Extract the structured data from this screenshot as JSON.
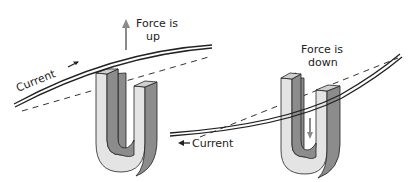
{
  "diagram": {
    "left_panel": {
      "force_label_line1": "Force is",
      "force_label_line2": "up",
      "current_label": "Current",
      "force_direction": "up",
      "current_direction": "right"
    },
    "right_panel": {
      "force_label_line1": "Force is",
      "force_label_line2": "down",
      "current_label": "Current",
      "force_direction": "down",
      "current_direction": "left"
    },
    "colors": {
      "magnet_light": "#e4e4e4",
      "magnet_dark": "#8c8c8c",
      "magnet_top": "#cfcfcf",
      "wire": "#222222",
      "force_arrow": "#8a8a8a"
    }
  }
}
